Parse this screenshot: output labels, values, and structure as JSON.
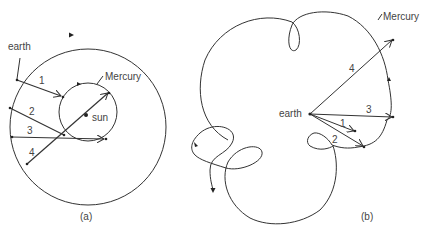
{
  "panel_a": {
    "caption": "(a)",
    "earth_label": "earth",
    "mercury_label": "Mercury",
    "sun_label": "sun",
    "arrow_labels": [
      "1",
      "2",
      "3",
      "4"
    ]
  },
  "panel_b": {
    "caption": "(b)",
    "earth_label": "earth",
    "mercury_label": "Mercury",
    "arrow_labels": [
      "1",
      "2",
      "3",
      "4"
    ]
  }
}
